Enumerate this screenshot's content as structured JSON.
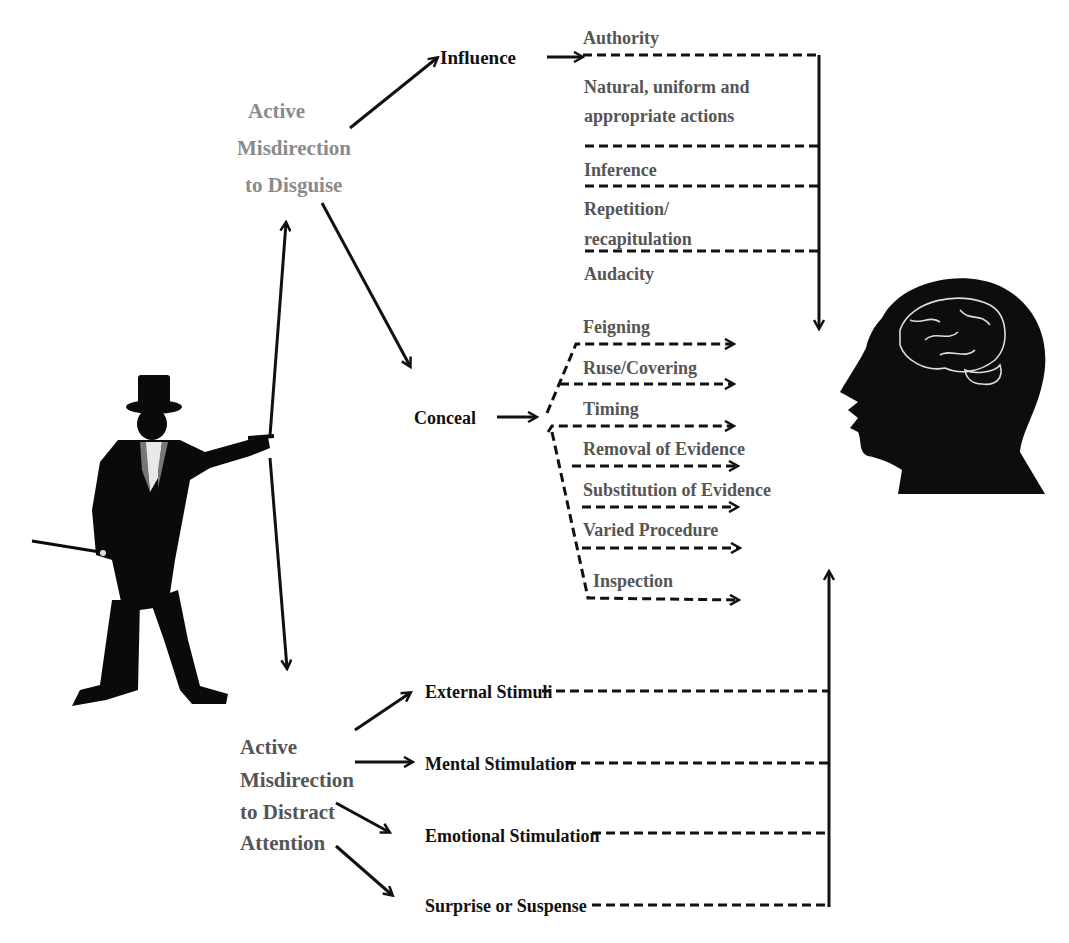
{
  "diagram": {
    "actor": "magician-silhouette",
    "target": "head-with-brain",
    "disguise": {
      "line1": "Active",
      "line2": "Misdirection",
      "line3": "to Disguise",
      "branches": {
        "influence": {
          "label": "Influence",
          "items": [
            "Authority",
            "Natural, uniform and",
            "appropriate actions",
            "Inference",
            "Repetition/",
            "recapitulation",
            "Audacity"
          ]
        },
        "conceal": {
          "label": "Conceal",
          "items": [
            "Feigning",
            "Ruse/Covering",
            "Timing",
            "Removal of Evidence",
            "Substitution of Evidence",
            "Varied Procedure",
            "Inspection"
          ]
        }
      }
    },
    "distract": {
      "line1": "Active",
      "line2": "Misdirection",
      "line3": "to Distract",
      "line4": "Attention",
      "items": [
        "External Stimuli",
        "Mental Stimulation",
        "Emotional Stimulation",
        "Surprise or Suspense"
      ]
    },
    "colors": {
      "ink": "#111111",
      "disguise_title": "#8a8a8a",
      "item_text": "#555555",
      "background": "#ffffff"
    }
  }
}
